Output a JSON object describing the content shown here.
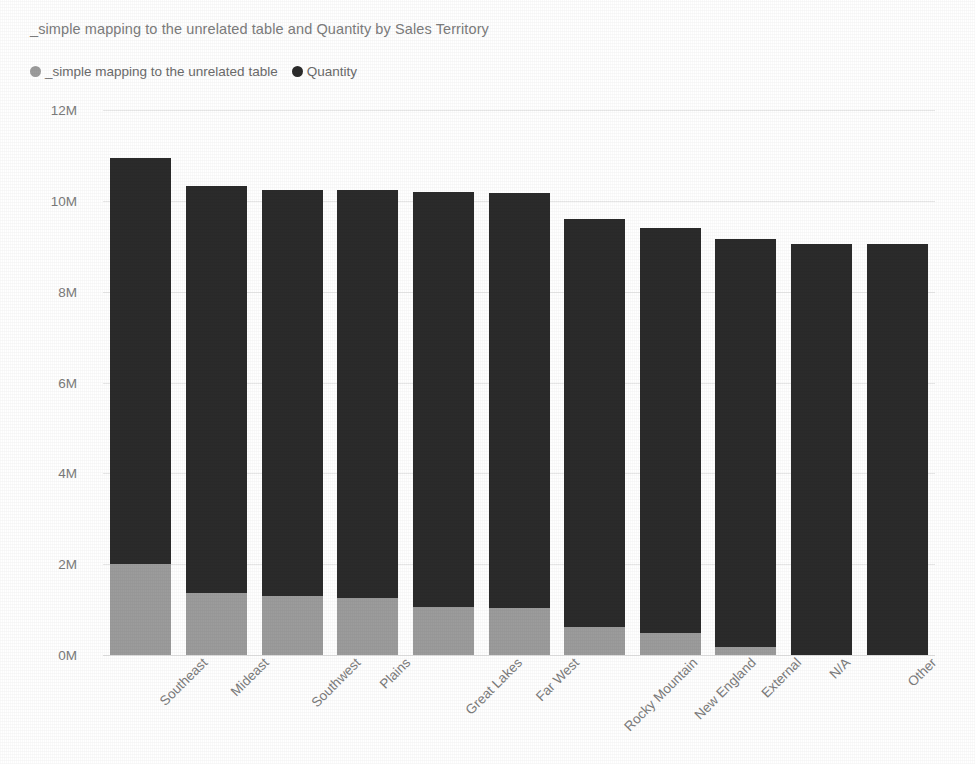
{
  "chart_data": {
    "type": "bar",
    "title": "_simple mapping to the unrelated table and Quantity by Sales Territory",
    "xlabel": "",
    "ylabel": "",
    "stacked": true,
    "grid": true,
    "legend_position": "top-left",
    "ylim": [
      0,
      12000000
    ],
    "ytick_labels": [
      "12M",
      "10M",
      "8M",
      "6M",
      "4M",
      "2M",
      "0M"
    ],
    "ytick_values": [
      12000000,
      10000000,
      8000000,
      6000000,
      4000000,
      2000000,
      0
    ],
    "categories": [
      "Southeast",
      "Mideast",
      "Southwest",
      "Plains",
      "Great Lakes",
      "Far West",
      "Rocky Mountain",
      "New England",
      "External",
      "N/A",
      "Other"
    ],
    "series": [
      {
        "name": "_simple mapping to the unrelated table",
        "color": "#9c9c9c",
        "values": [
          2000000,
          1360000,
          1290000,
          1250000,
          1060000,
          1040000,
          610000,
          480000,
          180000,
          0,
          0
        ]
      },
      {
        "name": "Quantity",
        "color": "#2b2b2b",
        "values": [
          8940000,
          8960000,
          8950000,
          8980000,
          9140000,
          9140000,
          8980000,
          8920000,
          8970000,
          9060000,
          9060000
        ]
      }
    ],
    "totals": [
      10940000,
      10320000,
      10240000,
      10230000,
      10200000,
      10180000,
      9590000,
      9400000,
      9150000,
      9060000,
      9060000
    ]
  },
  "legend": {
    "items": [
      {
        "label": "_simple mapping to the unrelated table",
        "color": "#9c9c9c"
      },
      {
        "label": "Quantity",
        "color": "#2b2b2b"
      }
    ]
  }
}
